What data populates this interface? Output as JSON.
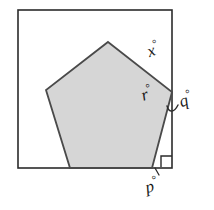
{
  "figure": {
    "background_color": "#ffffff",
    "outline_color": "#2b2b2b",
    "pentagon_fill": "#d6d6d6",
    "pentagon_stroke": "#4a4a4a",
    "label_color": "#1a1a1a",
    "degree_symbol": "°",
    "square": {
      "name": "outer-square",
      "stroke_color": "#2b2b2b",
      "stroke_width": 1.6,
      "x": 18,
      "y": 10,
      "width": 154,
      "height": 158
    },
    "pentagon": {
      "name": "shaded-pentagon",
      "fill": "#d6d6d6",
      "stroke_color": "#4a4a4a",
      "stroke_width": 1.8,
      "sides": 5,
      "points": "108,42 172,92 152,168 70,168 46,90"
    },
    "right_angle_marker": {
      "name": "right-angle-marker",
      "corner": "bottom-right",
      "size": 11,
      "stroke_color": "#2b2b2b"
    },
    "leader_lines": [
      {
        "name": "q-leader-arc",
        "for_label": "q"
      },
      {
        "name": "p-tick-mark",
        "for_label": "p"
      }
    ],
    "labels": [
      {
        "id": "x",
        "name": "angle-label-x",
        "text": "x",
        "degree": "°",
        "x": 147,
        "y": 40,
        "rotation": -20
      },
      {
        "id": "r",
        "name": "angle-label-r",
        "text": "r",
        "degree": "°",
        "x": 141,
        "y": 84,
        "rotation": -18
      },
      {
        "id": "q",
        "name": "angle-label-q",
        "text": "q",
        "degree": "°",
        "x": 179,
        "y": 90,
        "rotation": -18
      },
      {
        "id": "p",
        "name": "angle-label-p",
        "text": "p",
        "degree": "°",
        "x": 145,
        "y": 176,
        "rotation": -14
      }
    ]
  }
}
